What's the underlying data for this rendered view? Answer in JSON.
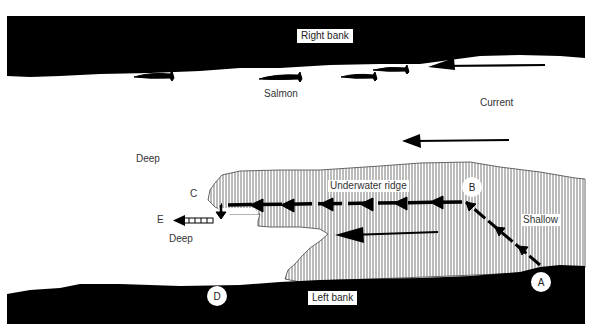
{
  "diagram": {
    "colors": {
      "bank": "#000000",
      "water": "#ffffff",
      "ridge_hatch": "#555555",
      "text": "#333333"
    },
    "banks": {
      "right": {
        "label": "Right bank"
      },
      "left": {
        "label": "Left bank"
      }
    },
    "labels": {
      "salmon": "Salmon",
      "current": "Current",
      "deep_upper": "Deep",
      "deep_lower": "Deep",
      "ridge": "Underwater ridge",
      "shallow": "Shallow"
    },
    "points": {
      "A": "A",
      "B": "B",
      "C": "C",
      "D": "D",
      "E": "E"
    },
    "fish_count": 4,
    "current_arrows": 3,
    "path": [
      "A",
      "B",
      "C",
      "E"
    ]
  }
}
